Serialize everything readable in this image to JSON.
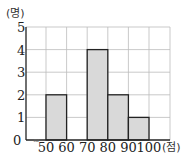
{
  "chart_data": {
    "type": "bar",
    "subtype": "histogram",
    "title": "",
    "xlabel": "",
    "ylabel": "",
    "x_unit": "(점)",
    "y_unit": "(명)",
    "bins": [
      [
        50,
        60
      ],
      [
        60,
        70
      ],
      [
        70,
        80
      ],
      [
        80,
        90
      ],
      [
        90,
        100
      ]
    ],
    "categories": [
      "50-60",
      "60-70",
      "70-80",
      "80-90",
      "90-100"
    ],
    "values": [
      2,
      0,
      4,
      2,
      1
    ],
    "x_ticks": [
      "50",
      "60",
      "70",
      "80",
      "90",
      "100"
    ],
    "y_ticks": [
      "0",
      "1",
      "2",
      "3",
      "4",
      "5"
    ],
    "ylim": [
      0,
      5
    ],
    "xlim": [
      40,
      110
    ],
    "grid": true,
    "axis_break": true,
    "legend": null,
    "colors": {
      "bar_fill": "#d9d9d9",
      "bar_stroke": "#222222",
      "grid": "#bbbbbb"
    }
  }
}
